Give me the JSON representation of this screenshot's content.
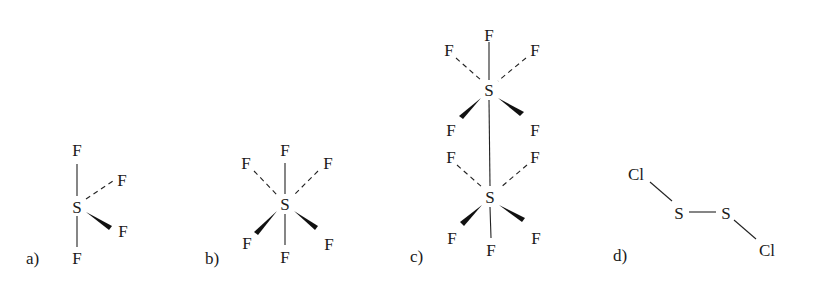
{
  "figure": {
    "panels": [
      {
        "id": "a",
        "label": "a)",
        "atoms": {
          "S": "S",
          "F_top": "F",
          "F_upper_right": "F",
          "F_lower_right": "F",
          "F_bottom": "F"
        },
        "bonds": [
          {
            "from": "S",
            "to": "F_top",
            "type": "single"
          },
          {
            "from": "S",
            "to": "F_upper_right",
            "type": "dashed"
          },
          {
            "from": "S",
            "to": "F_lower_right",
            "type": "wedge"
          },
          {
            "from": "S",
            "to": "F_bottom",
            "type": "single"
          }
        ]
      },
      {
        "id": "b",
        "label": "b)",
        "atoms": {
          "S": "S",
          "F_top": "F",
          "F_upper_left": "F",
          "F_upper_right": "F",
          "F_lower_left": "F",
          "F_lower_right": "F",
          "F_bottom": "F"
        },
        "bonds": [
          {
            "from": "S",
            "to": "F_top",
            "type": "single"
          },
          {
            "from": "S",
            "to": "F_upper_left",
            "type": "dashed"
          },
          {
            "from": "S",
            "to": "F_upper_right",
            "type": "dashed"
          },
          {
            "from": "S",
            "to": "F_lower_left",
            "type": "wedge"
          },
          {
            "from": "S",
            "to": "F_lower_right",
            "type": "wedge"
          },
          {
            "from": "S",
            "to": "F_bottom",
            "type": "single"
          }
        ]
      },
      {
        "id": "c",
        "label": "c)",
        "atoms": {
          "S_top": "S",
          "S_bottom": "S",
          "F_top": "F",
          "F_top_upper_left": "F",
          "F_top_upper_right": "F",
          "F_top_lower_left": "F",
          "F_top_lower_right": "F",
          "F_bot_upper_left": "F",
          "F_bot_upper_right": "F",
          "F_bot_lower_left": "F",
          "F_bot_lower_right": "F",
          "F_bottom": "F"
        },
        "bonds": [
          {
            "from": "S_top",
            "to": "S_bottom",
            "type": "single"
          },
          {
            "from": "S_top",
            "to": "F_top",
            "type": "single"
          },
          {
            "from": "S_top",
            "to": "F_top_upper_left",
            "type": "dashed"
          },
          {
            "from": "S_top",
            "to": "F_top_upper_right",
            "type": "dashed"
          },
          {
            "from": "S_top",
            "to": "F_top_lower_left",
            "type": "wedge"
          },
          {
            "from": "S_top",
            "to": "F_top_lower_right",
            "type": "wedge"
          },
          {
            "from": "S_bottom",
            "to": "F_bot_upper_left",
            "type": "dashed"
          },
          {
            "from": "S_bottom",
            "to": "F_bot_upper_right",
            "type": "dashed"
          },
          {
            "from": "S_bottom",
            "to": "F_bot_lower_left",
            "type": "wedge"
          },
          {
            "from": "S_bottom",
            "to": "F_bot_lower_right",
            "type": "wedge"
          },
          {
            "from": "S_bottom",
            "to": "F_bottom",
            "type": "single"
          }
        ]
      },
      {
        "id": "d",
        "label": "d)",
        "atoms": {
          "Cl_left": "Cl",
          "S_left": "S",
          "S_right": "S",
          "Cl_right": "Cl"
        },
        "bonds": [
          {
            "from": "Cl_left",
            "to": "S_left",
            "type": "single"
          },
          {
            "from": "S_left",
            "to": "S_right",
            "type": "single"
          },
          {
            "from": "S_right",
            "to": "Cl_right",
            "type": "single"
          }
        ]
      }
    ]
  }
}
